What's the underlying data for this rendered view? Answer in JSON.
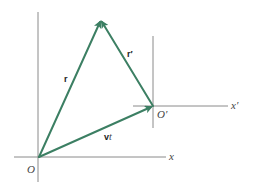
{
  "diagram": {
    "colors": {
      "vector": "#3c7f63",
      "axis": "#8a8a8a",
      "text": "#333333"
    },
    "frames": [
      {
        "id": "S",
        "origin_label": "O",
        "x_axis_label": "x",
        "origin": [
          39,
          157
        ]
      },
      {
        "id": "S_prime",
        "origin_label": "O′",
        "x_axis_label": "x′",
        "origin": [
          153,
          106
        ]
      }
    ],
    "vectors": [
      {
        "id": "r",
        "label": "r",
        "from": "O",
        "to": "P"
      },
      {
        "id": "r_prime",
        "label": "r′",
        "from": "O′",
        "to": "P"
      },
      {
        "id": "vt",
        "label": "vt",
        "from": "O",
        "to": "O′"
      }
    ],
    "labels": {
      "O": "O",
      "O_prime": "O′",
      "x": "x",
      "x_prime": "x′",
      "r": "r",
      "r_prime": "r′",
      "v": "v",
      "t": "t"
    }
  }
}
